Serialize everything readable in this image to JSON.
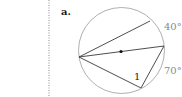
{
  "figure": {
    "part_label": "a.",
    "angle_labels": {
      "arc_top": "40°",
      "arc_bottom": "70°",
      "inscribed_angle": "1"
    },
    "colors": {
      "circle": "#9a9a9a",
      "chords": "#3a3a3a",
      "center_dot": "#111111",
      "divider": "#8a8a8a",
      "arc_labels": "#8a8a8a"
    }
  }
}
